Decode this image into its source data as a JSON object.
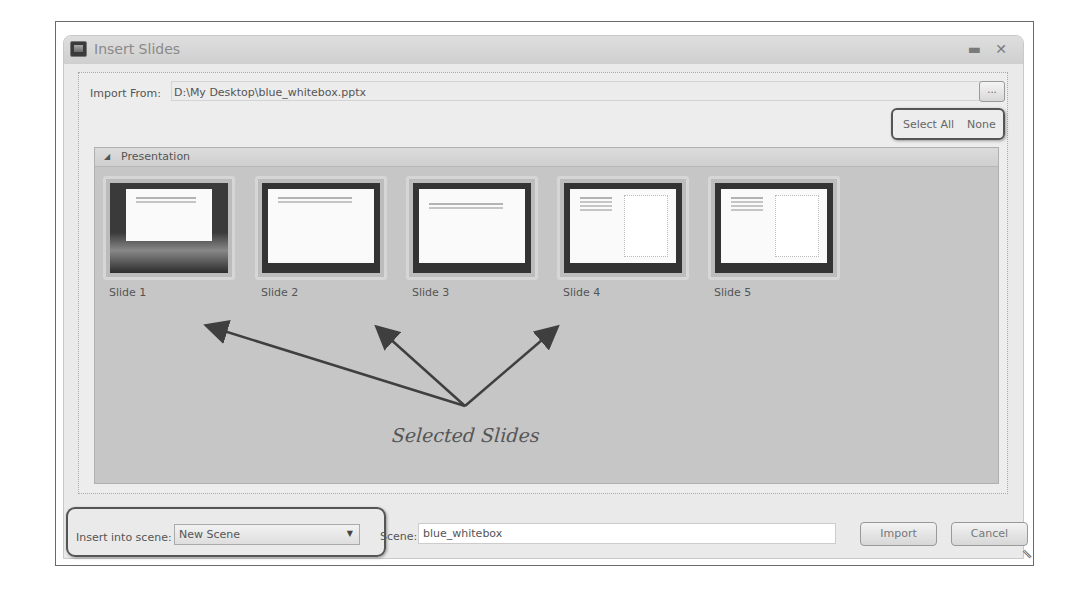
{
  "window": {
    "title": "Insert Slides",
    "minimize_icon": "minimize-icon",
    "close_icon": "close-icon"
  },
  "import_from": {
    "label": "Import From:",
    "path": "D:\\My Desktop\\blue_whitebox.pptx",
    "browse_label": "..."
  },
  "selection": {
    "select_all": "Select All",
    "none": "None"
  },
  "panel": {
    "title": "Presentation",
    "slides": [
      {
        "label": "Slide 1"
      },
      {
        "label": "Slide 2"
      },
      {
        "label": "Slide 3"
      },
      {
        "label": "Slide 4"
      },
      {
        "label": "Slide 5"
      }
    ]
  },
  "annotation": {
    "text": "Selected Slides"
  },
  "footer": {
    "insert_label": "Insert into scene:",
    "insert_value": "New Scene",
    "scene_label": "Scene:",
    "scene_value": "blue_whitebox",
    "import_button": "Import",
    "cancel_button": "Cancel"
  }
}
